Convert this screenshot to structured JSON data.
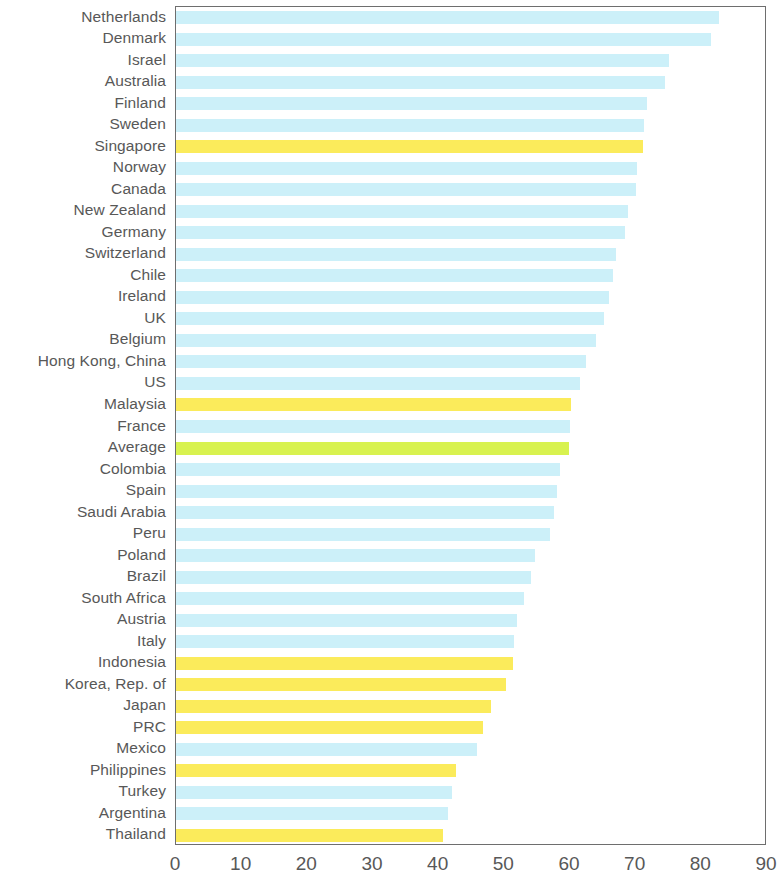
{
  "chart_data": {
    "type": "bar",
    "orientation": "horizontal",
    "title": "",
    "subtitle": "",
    "xlabel": "",
    "ylabel": "",
    "xlim": [
      0,
      90
    ],
    "ylim": null,
    "grid": false,
    "legend": null,
    "legend_position": "none",
    "xticks": [
      0,
      10,
      20,
      30,
      40,
      50,
      60,
      70,
      80,
      90
    ],
    "xtick_labels": [
      "0",
      "10",
      "20",
      "30",
      "40",
      "50",
      "60",
      "70",
      "80",
      "90"
    ],
    "colors": {
      "default_bar": "#CCF0F9",
      "highlight_bar": "#FBEB5B",
      "average_bar": "#D8F24F",
      "frame": "#6E6E6E",
      "text": "#585858",
      "background": "#FFFFFF"
    },
    "categories": [
      "Netherlands",
      "Denmark",
      "Israel",
      "Australia",
      "Finland",
      "Sweden",
      "Singapore",
      "Norway",
      "Canada",
      "New Zealand",
      "Germany",
      "Switzerland",
      "Chile",
      "Ireland",
      "UK",
      "Belgium",
      "Hong Kong, China",
      "US",
      "Malaysia",
      "France",
      "Average",
      "Colombia",
      "Spain",
      "Saudi Arabia",
      "Peru",
      "Poland",
      "Brazil",
      "South Africa",
      "Austria",
      "Italy",
      "Indonesia",
      "Korea, Rep. of",
      "Japan",
      "PRC",
      "Mexico",
      "Philippines",
      "Turkey",
      "Argentina",
      "Thailand"
    ],
    "values": [
      82.7,
      81.5,
      75.0,
      74.5,
      71.8,
      71.3,
      71.1,
      70.2,
      70.0,
      68.9,
      68.3,
      67.0,
      66.5,
      65.9,
      65.2,
      64.0,
      62.5,
      61.5,
      60.2,
      60.0,
      59.8,
      58.5,
      58.0,
      57.5,
      57.0,
      54.7,
      54.0,
      53.0,
      51.9,
      51.5,
      51.3,
      50.2,
      48.0,
      46.7,
      45.8,
      42.7,
      42.1,
      41.4,
      40.7
    ],
    "bar_styles": [
      "default",
      "default",
      "default",
      "default",
      "default",
      "default",
      "highlight",
      "default",
      "default",
      "default",
      "default",
      "default",
      "default",
      "default",
      "default",
      "default",
      "default",
      "default",
      "highlight",
      "default",
      "average",
      "default",
      "default",
      "default",
      "default",
      "default",
      "default",
      "default",
      "default",
      "default",
      "highlight",
      "highlight",
      "highlight",
      "highlight",
      "default",
      "highlight",
      "default",
      "default",
      "highlight"
    ]
  }
}
